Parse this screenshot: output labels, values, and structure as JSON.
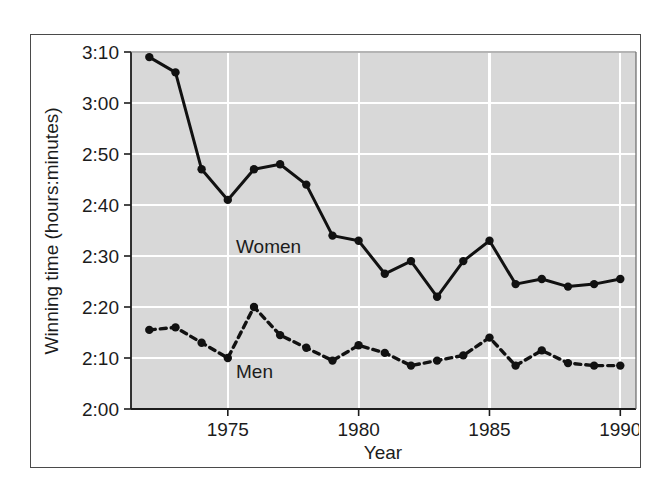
{
  "chart_data": {
    "type": "line",
    "title": "",
    "xlabel": "Year",
    "ylabel": "Winning time (hours:minutes)",
    "xlim": [
      1971.3,
      1990.6
    ],
    "ylim": [
      120,
      190
    ],
    "xticks": [
      1975,
      1980,
      1985,
      1990
    ],
    "xticklabels": [
      "1975",
      "1980",
      "1985",
      "1990"
    ],
    "yticks": [
      120,
      130,
      140,
      150,
      160,
      170,
      180,
      190
    ],
    "yticklabels": [
      "2:00",
      "2:10",
      "2:20",
      "2:30",
      "2:40",
      "2:50",
      "3:00",
      "3:10"
    ],
    "grid": true,
    "grid_color": "#ffffff",
    "plot_background": "#d8d8d8",
    "legend": "inline-labels",
    "x": [
      1972,
      1973,
      1974,
      1975,
      1976,
      1977,
      1978,
      1979,
      1980,
      1981,
      1982,
      1983,
      1984,
      1985,
      1986,
      1987,
      1988,
      1989,
      1990
    ],
    "series": [
      {
        "name": "Women",
        "label": "Women",
        "style": "solid",
        "color": "#111111",
        "marker": "circle",
        "values_minutes": [
          189,
          186,
          167,
          161,
          167,
          168,
          164,
          154,
          153,
          146.5,
          149,
          142,
          149,
          153,
          144.5,
          145.5,
          144,
          144.5,
          145.5
        ],
        "values_time": [
          "3:09",
          "3:06",
          "2:47",
          "2:41",
          "2:47",
          "2:48",
          "2:44",
          "2:34",
          "2:33",
          "2:26.5",
          "2:29",
          "2:22",
          "2:29",
          "2:33",
          "2:24.5",
          "2:25.5",
          "2:24",
          "2:24.5",
          "2:25.5"
        ]
      },
      {
        "name": "Men",
        "label": "Men",
        "style": "dashed",
        "color": "#111111",
        "marker": "circle",
        "values_minutes": [
          135.5,
          136,
          133,
          130,
          140,
          134.5,
          132,
          129.5,
          132.5,
          131,
          128.5,
          129.5,
          130.5,
          134,
          128.5,
          131.5,
          129,
          128.5,
          128.5
        ],
        "values_time": [
          "2:15.5",
          "2:16",
          "2:13",
          "2:10",
          "2:20",
          "2:14.5",
          "2:12",
          "2:09.5",
          "2:12.5",
          "2:11",
          "2:08.5",
          "2:09.5",
          "2:10.5",
          "2:14",
          "2:08.5",
          "2:11.5",
          "2:09",
          "2:08.5",
          "2:08.5"
        ]
      }
    ]
  },
  "labels": {
    "women": "Women",
    "men": "Men",
    "year_axis": "Year",
    "time_axis": "Winning time (hours:minutes)"
  }
}
